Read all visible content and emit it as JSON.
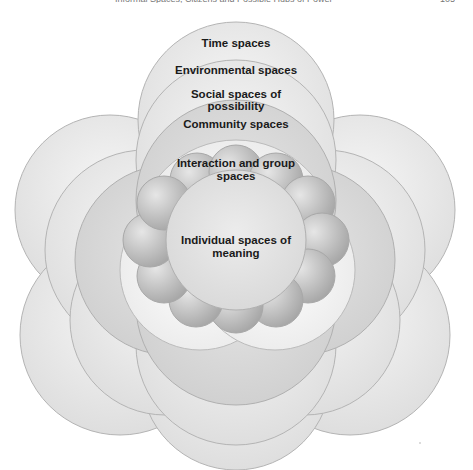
{
  "header": {
    "running_title": "Informal Spaces, Citizens and Possible Hubs of Power",
    "page_number": "105"
  },
  "diagram": {
    "type": "nested concentric spaces",
    "layers": [
      {
        "id": "time",
        "label": "Time spaces"
      },
      {
        "id": "environmental",
        "label": "Environmental spaces"
      },
      {
        "id": "social",
        "label_line1": "Social spaces of",
        "label_line2": "possibility"
      },
      {
        "id": "community",
        "label": "Community spaces"
      },
      {
        "id": "interaction",
        "label_line1": "Interaction and group",
        "label_line2": "spaces"
      },
      {
        "id": "individual",
        "label_line1": "Individual spaces of",
        "label_line2": "meaning"
      }
    ],
    "colors": {
      "outline": "#b0b0b0",
      "light_fill": "#ececec",
      "mid_fill": "#d6d6d6",
      "dark_fill": "#c8c8c8",
      "center_fill": "#e2e2e2",
      "bubble_dark": "#a9a9a9",
      "bubble_light": "#e6e6e6"
    }
  }
}
